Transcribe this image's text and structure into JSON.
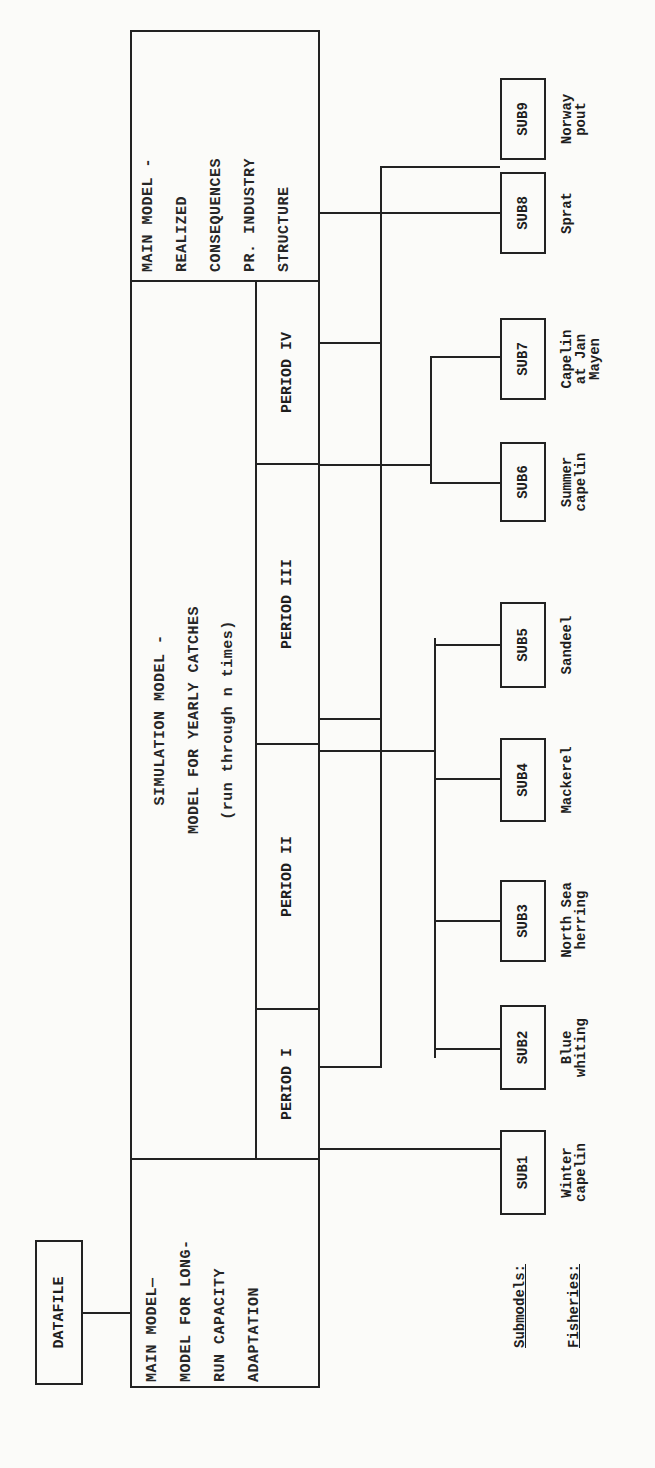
{
  "datafile": {
    "label": "DATAFILE"
  },
  "main_model_longrun": {
    "lines": [
      "MAIN MODEL—",
      "MODEL FOR LONG-",
      "RUN CAPACITY",
      "ADAPTATION"
    ]
  },
  "simulation_model": {
    "lines": [
      "SIMULATION MODEL -",
      "MODEL FOR YEARLY CATCHES",
      "(run through n times)"
    ]
  },
  "periods": [
    {
      "label": "PERIOD I"
    },
    {
      "label": "PERIOD II"
    },
    {
      "label": "PERIOD III"
    },
    {
      "label": "PERIOD IV"
    }
  ],
  "main_model_realized": {
    "lines": [
      "MAIN MODEL -",
      "REALIZED",
      "CONSEQUENCES",
      "PR. INDUSTRY",
      "STRUCTURE"
    ]
  },
  "legend": {
    "submodels": "Submodels:",
    "fisheries": "Fisheries:"
  },
  "submodels": [
    {
      "id": "SUB1",
      "fishery": "Winter\ncapelin"
    },
    {
      "id": "SUB2",
      "fishery": "Blue\nwhiting"
    },
    {
      "id": "SUB3",
      "fishery": "North Sea\nherring"
    },
    {
      "id": "SUB4",
      "fishery": "Mackerel"
    },
    {
      "id": "SUB5",
      "fishery": "Sandeel"
    },
    {
      "id": "SUB6",
      "fishery": "Summer\ncapelin"
    },
    {
      "id": "SUB7",
      "fishery": "Capelin\nat Jan\nMayen"
    },
    {
      "id": "SUB8",
      "fishery": "Sprat"
    },
    {
      "id": "SUB9",
      "fishery": "Norway\npout"
    }
  ]
}
